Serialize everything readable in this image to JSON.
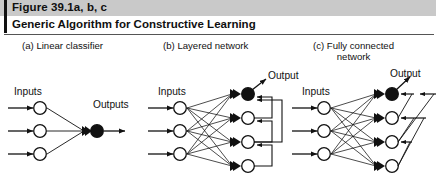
{
  "figure": {
    "label": "Figure 39.1a, b, c",
    "title": "Generic Algorithm for Constructive Learning",
    "accent_bar_color": "#111111",
    "title_bar_color": "#c9c9c9",
    "background_color": "#ffffff",
    "ink_color": "#111111"
  },
  "panels": [
    {
      "id": "a",
      "caption": "(a) Linear classifier",
      "inputs_label": "Inputs",
      "output_label": "Outputs",
      "input_nodes": 3,
      "hidden_nodes": 0,
      "output_nodes": 1,
      "feedback": "none"
    },
    {
      "id": "b",
      "caption": "(b) Layered network",
      "inputs_label": "Inputs",
      "output_label": "Output",
      "input_nodes": 3,
      "hidden_nodes": 3,
      "output_nodes": 1,
      "feedback": "cascade"
    },
    {
      "id": "c",
      "caption_line1": "(c) Fully connected",
      "caption_line2": "network",
      "inputs_label": "Inputs",
      "output_label": "Output",
      "input_nodes": 3,
      "hidden_nodes": 3,
      "output_nodes": 1,
      "feedback": "fully-connected"
    }
  ]
}
